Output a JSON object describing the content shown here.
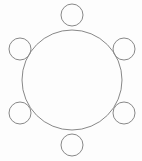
{
  "canvas": {
    "width": 142,
    "height": 161,
    "background_color": "#fdfdfd",
    "title": "Hexagonal arrangement of six small circles around one large circle"
  },
  "style": {
    "stroke_color": "#888888",
    "stroke_width": 1,
    "fill": "none"
  },
  "diagram": {
    "type": "geometric-figure",
    "shape_count": 7
  },
  "chart_data": {
    "type": "scatter",
    "xlabel": "",
    "ylabel": "",
    "xlim": [
      0,
      142
    ],
    "ylim": [
      0,
      161
    ],
    "grid": false,
    "legend": null,
    "shapes": [
      {
        "name": "large-circle",
        "role": "center",
        "cx": 72,
        "cy": 80,
        "r": 50,
        "stroke": "#888888",
        "stroke_width": 1,
        "fill": "none"
      },
      {
        "name": "small-circle-top",
        "role": "satellite",
        "angle_deg": -90,
        "cx": 72,
        "cy": 15,
        "r": 11,
        "stroke": "#888888",
        "stroke_width": 1,
        "fill": "none"
      },
      {
        "name": "small-circle-upper-right",
        "role": "satellite",
        "angle_deg": -30,
        "cx": 124,
        "cy": 49,
        "r": 11,
        "stroke": "#888888",
        "stroke_width": 1,
        "fill": "none"
      },
      {
        "name": "small-circle-lower-right",
        "role": "satellite",
        "angle_deg": 30,
        "cx": 124,
        "cy": 113,
        "r": 11,
        "stroke": "#888888",
        "stroke_width": 1,
        "fill": "none"
      },
      {
        "name": "small-circle-bottom",
        "role": "satellite",
        "angle_deg": 90,
        "cx": 72,
        "cy": 145,
        "r": 11,
        "stroke": "#888888",
        "stroke_width": 1,
        "fill": "none"
      },
      {
        "name": "small-circle-lower-left",
        "role": "satellite",
        "angle_deg": 150,
        "cx": 20,
        "cy": 113,
        "r": 11,
        "stroke": "#888888",
        "stroke_width": 1,
        "fill": "none"
      },
      {
        "name": "small-circle-upper-left",
        "role": "satellite",
        "angle_deg": 210,
        "cx": 20,
        "cy": 49,
        "r": 11,
        "stroke": "#888888",
        "stroke_width": 1,
        "fill": "none"
      }
    ]
  }
}
